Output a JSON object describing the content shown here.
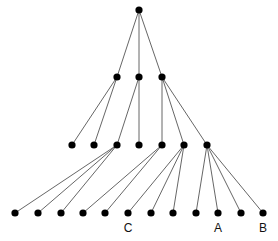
{
  "diagram": {
    "type": "tree",
    "node_radius": 3.6,
    "colors": {
      "node": "#000000",
      "edge": "#555555",
      "label": "#111111"
    },
    "nodes": [
      {
        "id": "r",
        "x": 139,
        "y": 10
      },
      {
        "id": "a1",
        "x": 117,
        "y": 77
      },
      {
        "id": "a2",
        "x": 139,
        "y": 77
      },
      {
        "id": "a3",
        "x": 162,
        "y": 77
      },
      {
        "id": "b1",
        "x": 72,
        "y": 145
      },
      {
        "id": "b2",
        "x": 94,
        "y": 145
      },
      {
        "id": "b3",
        "x": 117,
        "y": 145
      },
      {
        "id": "b4",
        "x": 139,
        "y": 145
      },
      {
        "id": "b5",
        "x": 162,
        "y": 145
      },
      {
        "id": "b6",
        "x": 184,
        "y": 145
      },
      {
        "id": "b7",
        "x": 207,
        "y": 145
      },
      {
        "id": "c1",
        "x": 15,
        "y": 213
      },
      {
        "id": "c2",
        "x": 38,
        "y": 213
      },
      {
        "id": "c3",
        "x": 61,
        "y": 213
      },
      {
        "id": "c4",
        "x": 83,
        "y": 213
      },
      {
        "id": "c5",
        "x": 105,
        "y": 213
      },
      {
        "id": "c6",
        "x": 128,
        "y": 213,
        "label": "C"
      },
      {
        "id": "c7",
        "x": 151,
        "y": 213
      },
      {
        "id": "c8",
        "x": 173,
        "y": 213
      },
      {
        "id": "c9",
        "x": 196,
        "y": 213
      },
      {
        "id": "c10",
        "x": 218,
        "y": 213,
        "label": "A"
      },
      {
        "id": "c11",
        "x": 241,
        "y": 213
      },
      {
        "id": "c12",
        "x": 263,
        "y": 213,
        "label": "B"
      }
    ],
    "edges": [
      [
        "r",
        "a1"
      ],
      [
        "r",
        "a2"
      ],
      [
        "r",
        "a3"
      ],
      [
        "a1",
        "b1"
      ],
      [
        "a1",
        "b2"
      ],
      [
        "a2",
        "b3"
      ],
      [
        "a2",
        "b4"
      ],
      [
        "a3",
        "b5"
      ],
      [
        "a3",
        "b6"
      ],
      [
        "a3",
        "b7"
      ],
      [
        "b3",
        "c1"
      ],
      [
        "b3",
        "c2"
      ],
      [
        "b3",
        "c3"
      ],
      [
        "b5",
        "c4"
      ],
      [
        "b5",
        "c5"
      ],
      [
        "b6",
        "c6"
      ],
      [
        "b6",
        "c7"
      ],
      [
        "b6",
        "c8"
      ],
      [
        "b7",
        "c9"
      ],
      [
        "b7",
        "c10"
      ],
      [
        "b7",
        "c11"
      ],
      [
        "b7",
        "c12"
      ]
    ],
    "labels": [
      {
        "text": "C",
        "x": 128,
        "y": 232
      },
      {
        "text": "A",
        "x": 218,
        "y": 232
      },
      {
        "text": "B",
        "x": 263,
        "y": 232
      }
    ]
  }
}
